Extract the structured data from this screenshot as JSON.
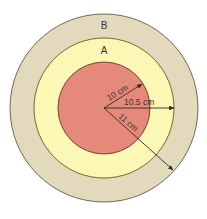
{
  "diagram": {
    "regions": [
      {
        "id": "B",
        "label": "B",
        "fill": "#e3d9bc",
        "stroke": "#6f6a55"
      },
      {
        "id": "A",
        "label": "A",
        "fill": "#fbf7b4",
        "stroke": "#6f6a30"
      },
      {
        "id": "inner",
        "label": "",
        "fill": "#e58a7a",
        "stroke": "#7a4032"
      }
    ],
    "radii": [
      {
        "label": "10 cm",
        "value": 10
      },
      {
        "label": "10.5 cm",
        "value": 10.5
      },
      {
        "label": "11 cm",
        "value": 11
      }
    ],
    "arrow_color": "#2e2a22",
    "text_color": "#3a3328"
  }
}
